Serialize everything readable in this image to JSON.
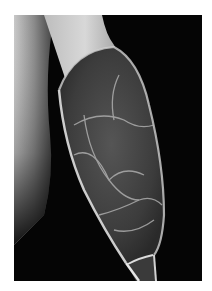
{
  "image": {
    "subject": "radiograph of long bone with expansile lytic lesion",
    "background_color": "#ffffff",
    "film_color": "#050505"
  }
}
